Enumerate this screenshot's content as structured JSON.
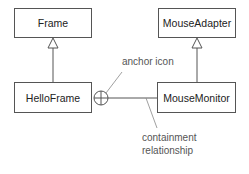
{
  "diagram": {
    "type": "UML class diagram",
    "classes": [
      {
        "id": "frame",
        "name": "Frame"
      },
      {
        "id": "mouse_adapter",
        "name": "MouseAdapter"
      },
      {
        "id": "hello_frame",
        "name": "HelloFrame"
      },
      {
        "id": "mouse_monitor",
        "name": "MouseMonitor"
      }
    ],
    "relationships": [
      {
        "from": "HelloFrame",
        "to": "Frame",
        "kind": "generalization"
      },
      {
        "from": "MouseMonitor",
        "to": "MouseAdapter",
        "kind": "generalization"
      },
      {
        "from": "HelloFrame",
        "to": "MouseMonitor",
        "kind": "containment (anchor)"
      }
    ],
    "annotations": {
      "anchor": "anchor icon",
      "containment_line1": "containment",
      "containment_line2": "relationship"
    },
    "colors": {
      "line": "#555555",
      "text": "#222222",
      "annotation": "#555555"
    }
  }
}
